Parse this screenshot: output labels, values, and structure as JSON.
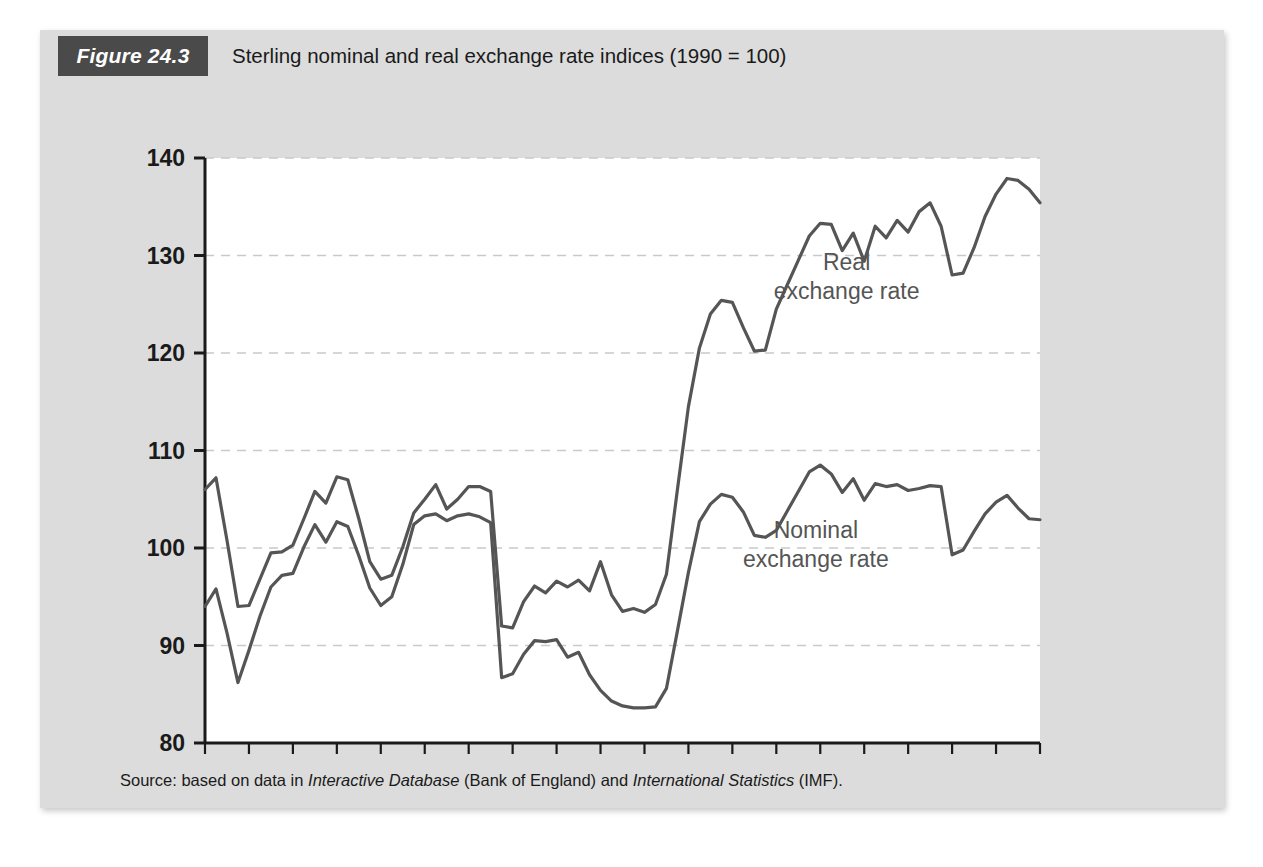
{
  "figure": {
    "badge": "Figure 24.3",
    "title": "Sterling nominal and real exchange rate indices (1990 = 100)",
    "source_prefix": "Source: based on data in ",
    "source_italic_1": "Interactive Database",
    "source_mid": " (Bank of England) and ",
    "source_italic_2": "International Statistics",
    "source_suffix": " (IMF)."
  },
  "colors": {
    "card_background": "#dcdcdc",
    "plot_background": "#ffffff",
    "badge_background": "#4a4a4a",
    "badge_text": "#ffffff",
    "axis": "#1a1a1a",
    "gridline": "#c9c9c9",
    "series_line": "#555555",
    "annotation_text": "#555555",
    "tick_label": "#1a1a1a"
  },
  "chart_data": {
    "type": "line",
    "title": "Sterling nominal and real exchange rate indices (1990 = 100)",
    "xlabel": "",
    "ylabel": "",
    "xlim": [
      1986,
      2005
    ],
    "ylim": [
      80,
      140
    ],
    "yticks": [
      80,
      90,
      100,
      110,
      120,
      130,
      140
    ],
    "ytick_labels": [
      "80",
      "90",
      "100",
      "110",
      "120",
      "130",
      "140"
    ],
    "xticks": [
      1986,
      1987,
      1988,
      1989,
      1990,
      1991,
      1992,
      1993,
      1994,
      1995,
      1996,
      1997,
      1998,
      1999,
      2000,
      2001,
      2002,
      2003,
      2004,
      2005
    ],
    "xtick_labels_shown": [
      "1986",
      "1988",
      "1990",
      "1992",
      "1994",
      "1996",
      "1998",
      "2000",
      "2002",
      "2004"
    ],
    "xtick_label_years": [
      1986,
      1988,
      1990,
      1992,
      1994,
      1996,
      1998,
      2000,
      2002,
      2004
    ],
    "grid": "horizontal-dashed",
    "legend": "inline-annotations",
    "x": [
      1986.0,
      1986.25,
      1986.5,
      1986.75,
      1987.0,
      1987.25,
      1987.5,
      1987.75,
      1988.0,
      1988.25,
      1988.5,
      1988.75,
      1989.0,
      1989.25,
      1989.5,
      1989.75,
      1990.0,
      1990.25,
      1990.5,
      1990.75,
      1991.0,
      1991.25,
      1991.5,
      1991.75,
      1992.0,
      1992.25,
      1992.5,
      1992.75,
      1993.0,
      1993.25,
      1993.5,
      1993.75,
      1994.0,
      1994.25,
      1994.5,
      1994.75,
      1995.0,
      1995.25,
      1995.5,
      1995.75,
      1996.0,
      1996.25,
      1996.5,
      1996.75,
      1997.0,
      1997.25,
      1997.5,
      1997.75,
      1998.0,
      1998.25,
      1998.5,
      1998.75,
      1999.0,
      1999.25,
      1999.5,
      1999.75,
      2000.0,
      2000.25,
      2000.5,
      2000.75,
      2001.0,
      2001.25,
      2001.5,
      2001.75,
      2002.0,
      2002.25,
      2002.5,
      2002.75,
      2003.0,
      2003.25,
      2003.5,
      2003.75,
      2004.0,
      2004.25,
      2004.5,
      2004.75,
      2005.0
    ],
    "series": [
      {
        "name": "Real exchange rate",
        "label": "Real\nexchange rate",
        "label_lines": [
          "Real",
          "exchange rate"
        ],
        "color": "#555555",
        "values": [
          106.0,
          107.2,
          100.8,
          94.0,
          94.1,
          96.8,
          99.5,
          99.6,
          100.3,
          103.0,
          105.8,
          104.6,
          107.3,
          107.0,
          103.0,
          98.6,
          96.8,
          97.2,
          100.1,
          103.6,
          105.0,
          106.5,
          104.0,
          105.0,
          106.3,
          106.3,
          105.8,
          92.0,
          91.8,
          94.5,
          96.1,
          95.4,
          96.6,
          96.0,
          96.7,
          95.6,
          98.6,
          95.2,
          93.5,
          93.8,
          93.4,
          94.2,
          97.3,
          106.0,
          114.5,
          120.5,
          124.0,
          125.4,
          125.2,
          122.6,
          120.2,
          120.3,
          124.5,
          127.0,
          129.5,
          132.0,
          133.3,
          133.2,
          130.5,
          132.3,
          129.4,
          133.0,
          131.8,
          133.6,
          132.4,
          134.5,
          135.4,
          133.0,
          128.0,
          128.2,
          130.8,
          134.0,
          136.3,
          137.9,
          137.7,
          136.8,
          135.4
        ]
      },
      {
        "name": "Nominal exchange rate",
        "label": "Nominal\nexchange rate",
        "label_lines": [
          "Nominal",
          "exchange rate"
        ],
        "color": "#555555",
        "values": [
          94.0,
          95.8,
          91.3,
          86.2,
          89.5,
          93.0,
          96.0,
          97.2,
          97.4,
          100.1,
          102.4,
          100.6,
          102.7,
          102.2,
          99.2,
          95.9,
          94.1,
          95.0,
          98.3,
          102.4,
          103.3,
          103.5,
          102.8,
          103.3,
          103.5,
          103.2,
          102.6,
          86.7,
          87.1,
          89.1,
          90.5,
          90.4,
          90.6,
          88.8,
          89.3,
          87.0,
          85.4,
          84.3,
          83.8,
          83.6,
          83.6,
          83.7,
          85.6,
          91.5,
          97.5,
          102.7,
          104.5,
          105.5,
          105.2,
          103.7,
          101.3,
          101.1,
          101.8,
          103.8,
          105.8,
          107.8,
          108.5,
          107.6,
          105.7,
          107.1,
          104.9,
          106.6,
          106.3,
          106.5,
          105.9,
          106.1,
          106.4,
          106.3,
          99.3,
          99.8,
          101.7,
          103.5,
          104.7,
          105.4,
          104.1,
          103.0,
          102.9
        ]
      }
    ],
    "annotations": [
      {
        "text_lines": [
          "Real",
          "exchange rate"
        ],
        "x": 2000.6,
        "y": 128.5
      },
      {
        "text_lines": [
          "Nominal",
          "exchange rate"
        ],
        "x": 1999.9,
        "y": 101.0
      }
    ]
  }
}
